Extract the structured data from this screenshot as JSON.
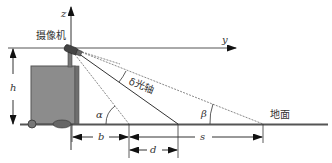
{
  "diagram": {
    "axes": {
      "z_label": "z",
      "y_label": "y"
    },
    "labels": {
      "camera": "摄像机",
      "optical_axis": "δ光轴",
      "ground": "地面",
      "alpha": "α",
      "beta": "β",
      "height": "h",
      "b": "b",
      "d": "d",
      "s": "s"
    },
    "colors": {
      "line": "#333333",
      "box_fill": "#8c8c8c",
      "box_edge": "#555555",
      "background": "#ffffff"
    }
  }
}
